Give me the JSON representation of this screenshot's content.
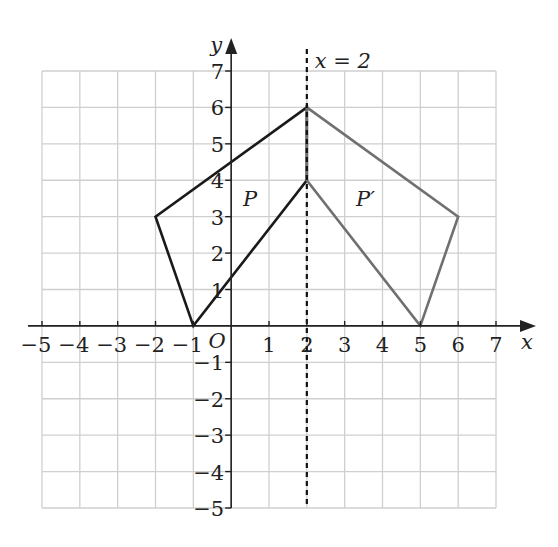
{
  "diagram": {
    "type": "coordinate-grid-reflection",
    "axes": {
      "x_label": "x",
      "y_label": "y",
      "origin_label": "O",
      "x_range": [
        -5,
        7
      ],
      "y_range": [
        -5,
        7
      ],
      "x_ticks": [
        "−5",
        "−4",
        "−3",
        "−2",
        "−1",
        "1",
        "2",
        "3",
        "4",
        "5",
        "6",
        "7"
      ],
      "x_tick_values": [
        -5,
        -4,
        -3,
        -2,
        -1,
        1,
        2,
        3,
        4,
        5,
        6,
        7
      ],
      "y_ticks": [
        "7",
        "6",
        "5",
        "4",
        "3",
        "2",
        "1",
        "−1",
        "−2",
        "−3",
        "−4",
        "−5"
      ],
      "y_tick_values": [
        7,
        6,
        5,
        4,
        3,
        2,
        1,
        -1,
        -2,
        -3,
        -4,
        -5
      ],
      "grid": true
    },
    "mirror_line": {
      "label": "x = 2",
      "x": 2,
      "style": "dashed"
    },
    "shapes": [
      {
        "name": "P",
        "label": "P",
        "color": "#1a1a1a",
        "vertices": [
          [
            -1,
            0
          ],
          [
            -2,
            3
          ],
          [
            2,
            6
          ],
          [
            2,
            4
          ]
        ]
      },
      {
        "name": "P-prime",
        "label": "P′",
        "color": "#707070",
        "vertices": [
          [
            2,
            6
          ],
          [
            6,
            3
          ],
          [
            5,
            0
          ],
          [
            2,
            4
          ]
        ]
      }
    ],
    "colors": {
      "grid": "#cfcfcf",
      "axis": "#222222",
      "text": "#222222"
    }
  }
}
